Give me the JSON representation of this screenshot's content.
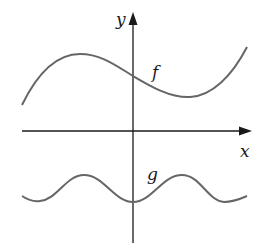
{
  "diagram": {
    "type": "function-graphs",
    "axes": {
      "x_label": "x",
      "y_label": "y",
      "axis_color": "#1a1a1a"
    },
    "curves": [
      {
        "name": "f",
        "label": "f",
        "description": "cubic-like curve: rises to a local maximum left of the y-axis, crosses the y-axis above the x-axis, dips to a local minimum right of the y-axis, then rises",
        "color": "#666666"
      },
      {
        "name": "g",
        "label": "g",
        "description": "periodic wave entirely below the x-axis with a local minimum on the y-axis and two peaks on either side",
        "color": "#666666"
      }
    ]
  }
}
